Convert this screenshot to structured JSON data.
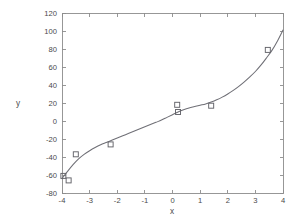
{
  "chart_data": {
    "type": "scatter",
    "title": "",
    "subtitle": "",
    "xlabel": "x",
    "ylabel": "y",
    "xlim": [
      -4,
      4
    ],
    "ylim": [
      -80,
      120
    ],
    "xticks": [
      -4,
      -3,
      -2,
      -1,
      0,
      1,
      2,
      3,
      4
    ],
    "xticklabels": [
      "-4",
      "-3",
      "-2",
      "-1",
      "0",
      "1",
      "2",
      "3",
      "4"
    ],
    "yticks": [
      -80,
      -60,
      -40,
      -20,
      0,
      20,
      40,
      60,
      80,
      100,
      120
    ],
    "yticklabels": [
      "-80",
      "-60",
      "-40",
      "-20",
      "0",
      "20",
      "40",
      "60",
      "80",
      "100",
      "120"
    ],
    "grid": false,
    "legend": null,
    "legend_position": "none",
    "series": [
      {
        "name": "data points",
        "type": "scatter",
        "marker": "open-square",
        "marker_size": 5,
        "color": "#636369",
        "points": [
          {
            "x": -3.95,
            "y": -61
          },
          {
            "x": -3.76,
            "y": -66
          },
          {
            "x": -3.5,
            "y": -37
          },
          {
            "x": -2.24,
            "y": -26
          },
          {
            "x": 0.17,
            "y": 18
          },
          {
            "x": 0.2,
            "y": 10
          },
          {
            "x": 1.4,
            "y": 17
          },
          {
            "x": 3.45,
            "y": 79
          }
        ]
      },
      {
        "name": "fitted curve",
        "type": "line",
        "color": "#6f6f76",
        "points": [
          {
            "x": -4.0,
            "y": -64.0
          },
          {
            "x": -3.8,
            "y": -56.0
          },
          {
            "x": -3.6,
            "y": -48.5
          },
          {
            "x": -3.4,
            "y": -42.0
          },
          {
            "x": -3.2,
            "y": -37.0
          },
          {
            "x": -3.0,
            "y": -33.0
          },
          {
            "x": -2.8,
            "y": -29.5
          },
          {
            "x": -2.6,
            "y": -26.5
          },
          {
            "x": -2.4,
            "y": -24.0
          },
          {
            "x": -2.2,
            "y": -21.5
          },
          {
            "x": -2.0,
            "y": -19.0
          },
          {
            "x": -1.8,
            "y": -16.5
          },
          {
            "x": -1.6,
            "y": -14.0
          },
          {
            "x": -1.4,
            "y": -11.5
          },
          {
            "x": -1.2,
            "y": -9.0
          },
          {
            "x": -1.0,
            "y": -6.5
          },
          {
            "x": -0.8,
            "y": -4.0
          },
          {
            "x": -0.6,
            "y": -1.5
          },
          {
            "x": -0.4,
            "y": 1.0
          },
          {
            "x": -0.2,
            "y": 4.0
          },
          {
            "x": 0.0,
            "y": 7.0
          },
          {
            "x": 0.2,
            "y": 10.0
          },
          {
            "x": 0.4,
            "y": 12.5
          },
          {
            "x": 0.6,
            "y": 14.5
          },
          {
            "x": 0.8,
            "y": 16.0
          },
          {
            "x": 1.0,
            "y": 17.5
          },
          {
            "x": 1.2,
            "y": 19.0
          },
          {
            "x": 1.4,
            "y": 21.0
          },
          {
            "x": 1.6,
            "y": 23.5
          },
          {
            "x": 1.8,
            "y": 26.5
          },
          {
            "x": 2.0,
            "y": 30.0
          },
          {
            "x": 2.2,
            "y": 34.0
          },
          {
            "x": 2.4,
            "y": 38.5
          },
          {
            "x": 2.6,
            "y": 43.5
          },
          {
            "x": 2.8,
            "y": 49.0
          },
          {
            "x": 3.0,
            "y": 55.0
          },
          {
            "x": 3.2,
            "y": 62.0
          },
          {
            "x": 3.4,
            "y": 70.0
          },
          {
            "x": 3.6,
            "y": 78.5
          },
          {
            "x": 3.8,
            "y": 89.0
          },
          {
            "x": 4.0,
            "y": 101.0
          }
        ]
      }
    ]
  },
  "figure": {
    "background_color": "#ffffff",
    "axis_color": "#8c8c8c",
    "text_color": "#4a4a4a"
  }
}
